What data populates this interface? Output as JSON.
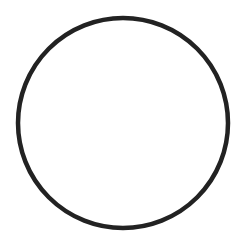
{
  "canvas": {
    "width": 248,
    "height": 246,
    "background": "#ffffff"
  },
  "shape": {
    "type": "circle",
    "cx": 123,
    "cy": 123,
    "r": 105,
    "stroke": "#222222",
    "stroke_width": 4.5,
    "fill": "none"
  }
}
